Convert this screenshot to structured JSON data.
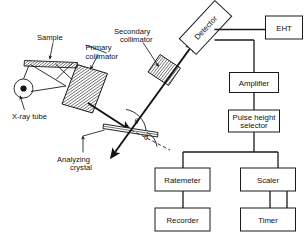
{
  "figure": {
    "background_color": "#ffffff",
    "ink_color": "#1a1a1a",
    "width": 307,
    "height": 237
  },
  "labels": {
    "sample": "Sample",
    "primary_collimator_line1": "Primary",
    "primary_collimator_line2": "collimator",
    "secondary_collimator_line1": "Secondary",
    "secondary_collimator_line2": "collimator",
    "xray_tube": "X-ray tube",
    "analyzing_crystal_line1": "Analyzing",
    "analyzing_crystal_line2": "crystal",
    "theta_upper": "θ",
    "theta_lower": "θ"
  },
  "boxes": {
    "detector": "Detector",
    "eht": "EHT",
    "amplifier": "Amplifier",
    "pulse_height_line1": "Pulse height",
    "pulse_height_line2": "selector",
    "ratemeter": "Ratemeter",
    "scaler": "Scaler",
    "recorder": "Recorder",
    "timer": "Timer"
  }
}
